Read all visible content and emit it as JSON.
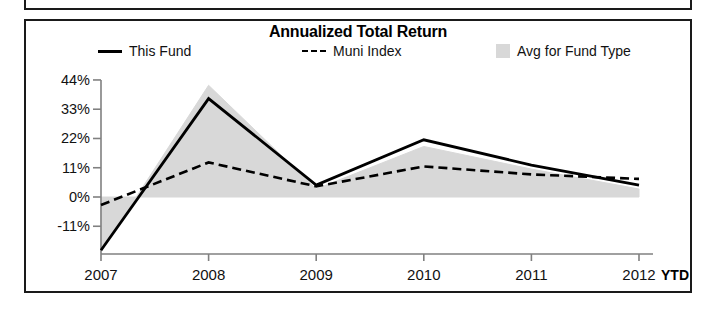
{
  "panel": {
    "title": "Annualized Total Return"
  },
  "legend": {
    "items": [
      {
        "label": "This Fund",
        "marker": "solid-line-swatch"
      },
      {
        "label": "Muni Index",
        "marker": "dashed-line-swatch"
      },
      {
        "label": "Avg for Fund Type",
        "marker": "area-swatch"
      }
    ]
  },
  "axis": {
    "ytd_note": "YTD"
  },
  "colors": {
    "line": "#000000",
    "area_fill": "#d8d8d8",
    "axis": "#808080",
    "frame": "#1a1a1a",
    "text": "#111111"
  },
  "chart_data": {
    "type": "line",
    "title": "Annualized Total Return",
    "xlabel": "",
    "ylabel": "",
    "x": [
      "2007",
      "2008",
      "2009",
      "2010",
      "2011",
      "2012"
    ],
    "xlim": [
      2007,
      2012
    ],
    "ylim": [
      -22,
      46
    ],
    "yticks": [
      -11,
      0,
      11,
      22,
      33,
      44
    ],
    "ytick_labels": [
      "-11%",
      "0%",
      "11%",
      "22%",
      "33%",
      "44%"
    ],
    "grid": false,
    "legend_position": "top",
    "series": [
      {
        "name": "This Fund",
        "style": "solid",
        "values": [
          -20.0,
          37.0,
          4.5,
          21.5,
          12.0,
          4.5
        ]
      },
      {
        "name": "Muni Index",
        "style": "dashed",
        "values": [
          -3.0,
          13.0,
          4.0,
          11.5,
          8.5,
          6.8
        ]
      },
      {
        "name": "Avg for Fund Type",
        "style": "area",
        "values": [
          -20.5,
          42.0,
          3.0,
          19.0,
          10.5,
          3.0
        ],
        "baseline": 0
      }
    ]
  }
}
